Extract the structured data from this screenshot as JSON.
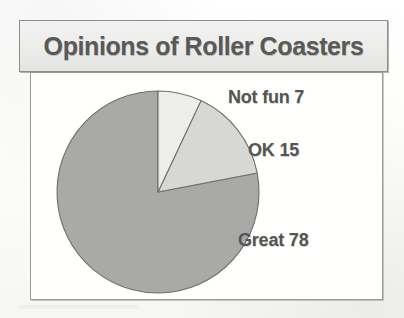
{
  "figure": {
    "title": "Opinions of Roller Coasters"
  },
  "chart_data": {
    "type": "pie",
    "title": "Opinions of Roller Coasters",
    "xlabel": "",
    "ylabel": "",
    "legend_position": "none",
    "grid": false,
    "start_angle_deg": 0,
    "direction": "clockwise",
    "categories": [
      "Not fun",
      "OK",
      "Great"
    ],
    "values": [
      7,
      15,
      78
    ],
    "value_unit": "percent",
    "total": 100,
    "slices": [
      {
        "label": "Not fun",
        "value": 7,
        "data_label": "Not fun 7",
        "color": "#ededeb",
        "start_deg": 0,
        "end_deg": 25.2
      },
      {
        "label": "OK",
        "value": 15,
        "data_label": "OK 15",
        "color": "#d7d7d5",
        "start_deg": 25.2,
        "end_deg": 79.2
      },
      {
        "label": "Great",
        "value": 78,
        "data_label": "Great 78",
        "color": "#a9a9a7",
        "start_deg": 79.2,
        "end_deg": 360
      }
    ],
    "colors": {
      "not_fun": "#ededeb",
      "ok": "#d7d7d5",
      "great": "#a9a9a7",
      "slice_outline": "#6f6f6d",
      "title_text": "#595957",
      "label_text": "#555553",
      "title_background": "#ececea",
      "chart_background": "#fffffe",
      "frame_border": "#8d8d8b"
    }
  }
}
